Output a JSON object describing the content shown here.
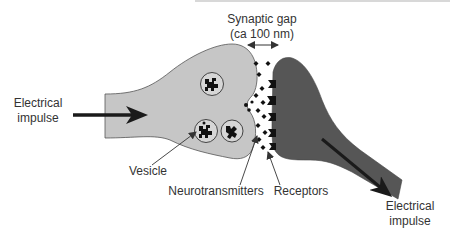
{
  "diagram": {
    "labels": {
      "synaptic_gap_line1": "Synaptic gap",
      "synaptic_gap_line2": "(ca 100 nm)",
      "input_impulse_line1": "Electrical",
      "input_impulse_line2": "impulse",
      "output_impulse_line1": "Electrical",
      "output_impulse_line2": "impulse",
      "vesicle": "Vesicle",
      "neurotransmitters": "Neurotransmitters",
      "receptors": "Receptors"
    },
    "colors": {
      "presynaptic_fill": "#c6c6c6",
      "presynaptic_stroke": "#555555",
      "postsynaptic_fill": "#565656",
      "arrow": "#1a1a1a",
      "text": "#333333",
      "background": "#ffffff"
    },
    "components": [
      {
        "name": "presynaptic-terminal",
        "shade": "light gray"
      },
      {
        "name": "postsynaptic-cell",
        "shade": "dark gray"
      },
      {
        "name": "vesicles",
        "count": 3
      },
      {
        "name": "fusing-vesicle",
        "count": 1
      },
      {
        "name": "neurotransmitters",
        "shape": "diamond"
      },
      {
        "name": "receptors",
        "shape": "notched block"
      }
    ]
  }
}
